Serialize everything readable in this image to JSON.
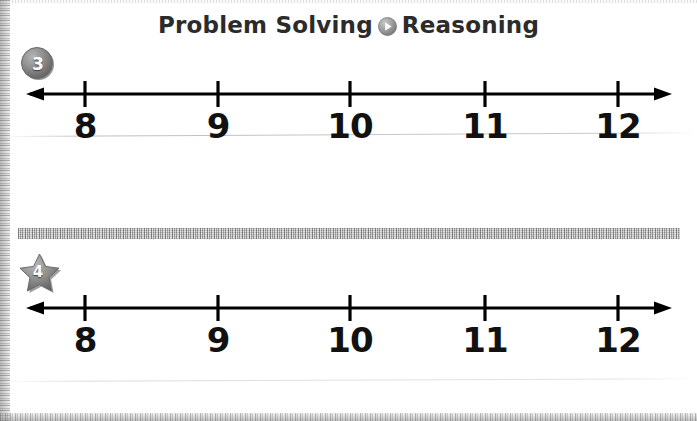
{
  "page": {
    "width": 697,
    "height": 421,
    "background": "#ffffff"
  },
  "header": {
    "part1": "Problem Solving",
    "part2": "Reasoning",
    "separator_icon": "play-circle-icon",
    "icon_color": "#8d8d8d",
    "text_color": "#2b2b2b"
  },
  "exercises": [
    {
      "number": "3",
      "badge_shape": "circle",
      "badge_color": "#7d7d7d",
      "numberline": {
        "labels": [
          "8",
          "9",
          "10",
          "11",
          "12"
        ],
        "tick_positions": [
          85,
          218,
          350,
          485,
          618
        ],
        "line_start": 26,
        "line_end": 672,
        "left_arrow": true,
        "right_arrow": true,
        "stroke_color": "#000000"
      }
    },
    {
      "number": "4",
      "badge_shape": "star",
      "badge_color": "#7d7d7d",
      "numberline": {
        "labels": [
          "8",
          "9",
          "10",
          "11",
          "12"
        ],
        "tick_positions": [
          85,
          218,
          350,
          485,
          618
        ],
        "line_start": 26,
        "line_end": 672,
        "left_arrow": true,
        "right_arrow": true,
        "stroke_color": "#000000"
      }
    }
  ],
  "divider": {
    "style": "textured-gray-bar",
    "color": "#bdbdbd"
  }
}
